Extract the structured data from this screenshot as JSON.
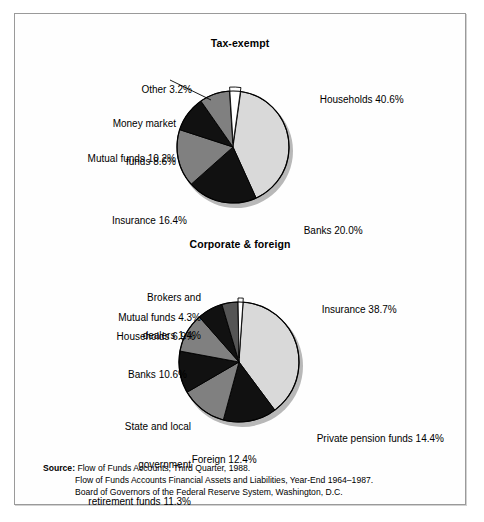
{
  "figure": {
    "source": {
      "label": "Source:",
      "lines": [
        "Flow of Funds Accounts, Third Quarter, 1988.",
        "Flow of Funds Accounts Financial Assets and Liabilities, Year-End 1964–1987.",
        "Board of Governors of the Federal Reserve System, Washington, D.C."
      ]
    }
  },
  "palette": {
    "light_gray": "#d9d9d9",
    "medium_gray": "#808080",
    "dark_gray": "#333333",
    "black": "#111111",
    "white": "#ffffff",
    "outline": "#000000",
    "shadow": "#b8b8b8"
  },
  "chart_data": [
    {
      "type": "pie",
      "title": "Tax-exempt",
      "start_angle_deg": 8,
      "direction": "clockwise",
      "categories": [
        "Households",
        "Banks",
        "Insurance",
        "Mutual funds",
        "Money market funds",
        "Other"
      ],
      "values": [
        40.6,
        20.0,
        16.4,
        10.2,
        8.6,
        3.2
      ],
      "labels": [
        "Households 40.6%",
        "Banks 20.0%",
        "Insurance 16.4%",
        "Mutual funds 10.2%",
        "Money market\nfunds 8.6%",
        "Other 3.2%"
      ],
      "fills": [
        "#d9d9d9",
        "#111111",
        "#808080",
        "#111111",
        "#808080",
        "#ffffff"
      ],
      "unit": "percent",
      "legend": "none",
      "grid": false
    },
    {
      "type": "pie",
      "title": "Corporate & foreign",
      "start_angle_deg": 4,
      "direction": "clockwise",
      "categories": [
        "Insurance",
        "Private pension funds",
        "Foreign",
        "State and local government retirement funds",
        "Banks",
        "Households",
        "Mutual funds",
        "Brokers and dealers"
      ],
      "values": [
        38.7,
        14.4,
        12.4,
        11.3,
        10.6,
        6.9,
        4.3,
        1.4
      ],
      "labels": [
        "Insurance 38.7%",
        "Private pension funds 14.4%",
        "Foreign 12.4%",
        "State and local\ngovernment\nretirement funds 11.3%",
        "Banks 10.6%",
        "Households 6.9%",
        "Mutual funds 4.3%",
        "Brokers and\ndealers 1.4%"
      ],
      "fills": [
        "#d9d9d9",
        "#111111",
        "#808080",
        "#111111",
        "#808080",
        "#111111",
        "#555555",
        "#ffffff"
      ],
      "unit": "percent",
      "legend": "none",
      "grid": false
    }
  ],
  "annotations": {
    "tax": {
      "households": "Households 40.6%",
      "banks": "Banks 20.0%",
      "insurance": "Insurance 16.4%",
      "mutual_funds": "Mutual funds 10.2%",
      "money_market_l1": "Money market",
      "money_market_l2": "funds 8.6%",
      "other": "Other 3.2%"
    },
    "corp": {
      "insurance": "Insurance 38.7%",
      "private_pension": "Private pension funds 14.4%",
      "foreign": "Foreign 12.4%",
      "state_local_l1": "State and local",
      "state_local_l2": "government",
      "state_local_l3": "retirement funds 11.3%",
      "banks": "Banks 10.6%",
      "households": "Households 6.9%",
      "mutual_funds": "Mutual funds 4.3%",
      "brokers_l1": "Brokers and",
      "brokers_l2": "dealers 1.4%"
    }
  }
}
